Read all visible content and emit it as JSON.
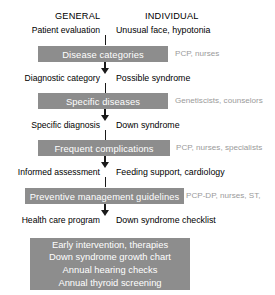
{
  "diagram": {
    "columns": {
      "general": "GENERAL",
      "individual": "INDIVIDUAL"
    },
    "colors": {
      "bar_fill": "#8d8d8d",
      "bar_text": "#ffffff",
      "actor_text": "#9a9a9a",
      "connector": "#1a1a1a",
      "background": "#ffffff"
    },
    "top_labels": {
      "general": "Patient evaluation",
      "individual": "Unusual face, hypotonia"
    },
    "steps": [
      {
        "bar": "Disease categories",
        "actors": "PCP, nurses",
        "general": "Diagnostic category",
        "individual": "Possible syndrome"
      },
      {
        "bar": "Specific diseases",
        "actors": "Genetiscists, counselors",
        "general": "Specific diagnosis",
        "individual": "Down syndrome"
      },
      {
        "bar": "Frequent complications",
        "actors": "PCP, nurses, specialists",
        "general": "Informed assessment",
        "individual": "Feeding support, cardiology"
      },
      {
        "bar": "Preventive management guidelines",
        "actors": "PCP-DP, nurses, ST,",
        "general": "Health care program",
        "individual": "Down syndrome checklist"
      }
    ],
    "outcome_panel": {
      "lines": [
        "Early intervention, therapies",
        "Down syndrome growth chart",
        "Annual hearing checks",
        "Annual thyroid screening"
      ]
    }
  }
}
